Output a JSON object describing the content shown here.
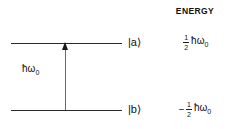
{
  "figure": {
    "type": "two-level-energy-diagram",
    "energy_column_header": "ENERGY",
    "transition": {
      "label_hbar": "ħ",
      "label_omega": "ω",
      "label_omega_subscript": "0",
      "direction": "upward",
      "arrow_icon": "up-arrow-icon"
    },
    "levels": [
      {
        "id": "upper",
        "ket": "|a⟩",
        "energy_sign": "",
        "energy_numerator": "1",
        "energy_denominator": "2",
        "energy_expr_hbar": "ħ",
        "energy_expr_omega": "ω",
        "energy_expr_subscript": "0"
      },
      {
        "id": "lower",
        "ket": "|b⟩",
        "energy_sign": "−",
        "energy_numerator": "1",
        "energy_denominator": "2",
        "energy_expr_hbar": "ħ",
        "energy_expr_omega": "ω",
        "energy_expr_subscript": "0"
      }
    ],
    "colors": {
      "line": "#2b2b2b",
      "arrow_shaft": "#6a6a6a",
      "arrow_head": "#1a1a1a",
      "text": "#111111",
      "background": "#ffffff"
    }
  }
}
